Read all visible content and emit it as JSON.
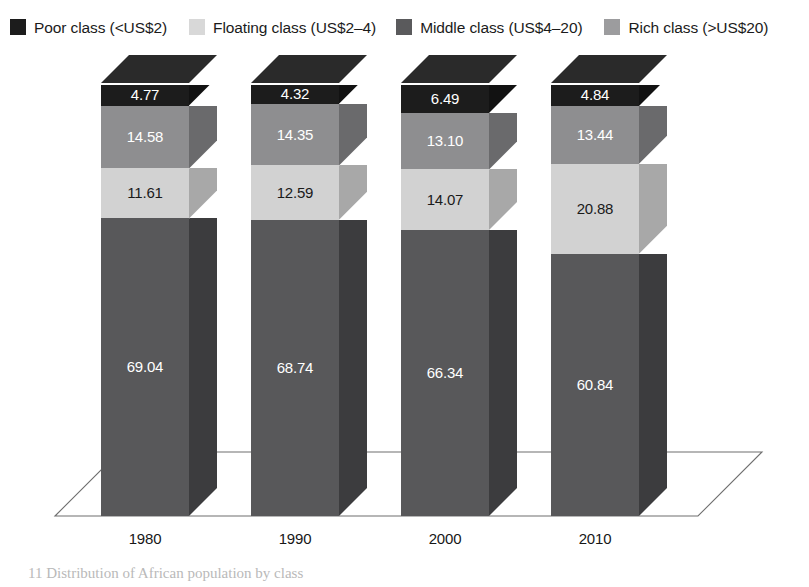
{
  "chart_data": {
    "type": "bar",
    "subtype": "stacked-column-3d",
    "title": "",
    "xlabel": "",
    "ylabel": "",
    "ylim": [
      0,
      100
    ],
    "grid": false,
    "legend_position": "top-left",
    "stack_order_bottom_to_top": [
      "Poor class (<US$2)",
      "Floating class (US$2–4)",
      "Middle class (US$4–20)",
      "Rich class (>US$20)"
    ],
    "categories": [
      "1980",
      "1990",
      "2000",
      "2010"
    ],
    "series": [
      {
        "name": "Poor class (<US$2)",
        "color": "#58585a",
        "values": [
          69.04,
          68.74,
          66.34,
          60.84
        ]
      },
      {
        "name": "Floating class (US$2–4)",
        "color": "#d2d2d2",
        "values": [
          11.61,
          12.59,
          14.07,
          20.88
        ]
      },
      {
        "name": "Middle class (US$4–20)",
        "color": "#8e8e90",
        "values": [
          14.58,
          14.35,
          13.1,
          13.44
        ]
      },
      {
        "name": "Rich class (>US$20)",
        "color": "#1c1c1c",
        "values": [
          4.77,
          4.32,
          6.49,
          4.84
        ]
      }
    ],
    "data_labels": {
      "1980": {
        "Rich class (>US$20)": "4.77",
        "Middle class (US$4–20)": "14.58",
        "Floating class (US$2–4)": "11.61",
        "Poor class (<US$2)": "69.04"
      },
      "1990": {
        "Rich class (>US$20)": "4.32",
        "Middle class (US$4–20)": "14.35",
        "Floating class (US$2–4)": "12.59",
        "Poor class (<US$2)": "68.74"
      },
      "2000": {
        "Rich class (>US$20)": "6.49",
        "Middle class (US$4–20)": "13.10",
        "Floating class (US$2–4)": "14.07",
        "Poor class (<US$2)": "66.34"
      },
      "2010": {
        "Rich class (>US$20)": "4.84",
        "Middle class (US$4–20)": "13.44",
        "Floating class (US$2–4)": "20.88",
        "Poor class (<US$2)": "60.84"
      }
    }
  },
  "legend": {
    "items": [
      {
        "label": "Poor class (<US$2)",
        "color": "#1c1c1c",
        "swatch_name": "legend-swatch-poor"
      },
      {
        "label": "Floating class (US$2–4)",
        "color": "#d8d8d8",
        "swatch_name": "legend-swatch-floating"
      },
      {
        "label": "Middle class (US$4–20)",
        "color": "#5a5a5c",
        "swatch_name": "legend-swatch-middle"
      },
      {
        "label": "Rich class (>US$20)",
        "color": "#9c9c9e",
        "swatch_name": "legend-swatch-rich"
      }
    ]
  },
  "axis": {
    "labels": [
      "1980",
      "1990",
      "2000",
      "2010"
    ]
  },
  "bars": [
    {
      "year": "1980",
      "segments": [
        {
          "cls": "rich",
          "label": "4.77",
          "text_color": "#ffffff"
        },
        {
          "cls": "middle",
          "label": "14.58",
          "text_color": "#ffffff"
        },
        {
          "cls": "floating",
          "label": "11.61",
          "text_color": "#1a1a1a"
        },
        {
          "cls": "poor",
          "label": "69.04",
          "text_color": "#ffffff"
        }
      ]
    },
    {
      "year": "1990",
      "segments": [
        {
          "cls": "rich",
          "label": "4.32",
          "text_color": "#ffffff"
        },
        {
          "cls": "middle",
          "label": "14.35",
          "text_color": "#ffffff"
        },
        {
          "cls": "floating",
          "label": "12.59",
          "text_color": "#1a1a1a"
        },
        {
          "cls": "poor",
          "label": "68.74",
          "text_color": "#ffffff"
        }
      ]
    },
    {
      "year": "2000",
      "segments": [
        {
          "cls": "rich",
          "label": "6.49",
          "text_color": "#ffffff"
        },
        {
          "cls": "middle",
          "label": "13.10",
          "text_color": "#ffffff"
        },
        {
          "cls": "floating",
          "label": "14.07",
          "text_color": "#1a1a1a"
        },
        {
          "cls": "poor",
          "label": "66.34",
          "text_color": "#ffffff"
        }
      ]
    },
    {
      "year": "2010",
      "segments": [
        {
          "cls": "rich",
          "label": "4.84",
          "text_color": "#ffffff"
        },
        {
          "cls": "middle",
          "label": "13.44",
          "text_color": "#ffffff"
        },
        {
          "cls": "floating",
          "label": "20.88",
          "text_color": "#1a1a1a"
        },
        {
          "cls": "poor",
          "label": "60.84",
          "text_color": "#ffffff"
        }
      ]
    }
  ],
  "caption": {
    "text": "11  Distribution of African population by class"
  },
  "colors": {
    "poor_front": "#58585a",
    "poor_side": "#3c3c3e",
    "floating_front": "#d2d2d2",
    "floating_side": "#a8a8a8",
    "middle_front": "#8e8e90",
    "middle_side": "#6a6a6c",
    "rich_front": "#1c1c1c",
    "rich_side": "#121212",
    "rich_cap": "#2a2a2a",
    "floor_line": "#6f6f6f",
    "background": "#ffffff"
  }
}
